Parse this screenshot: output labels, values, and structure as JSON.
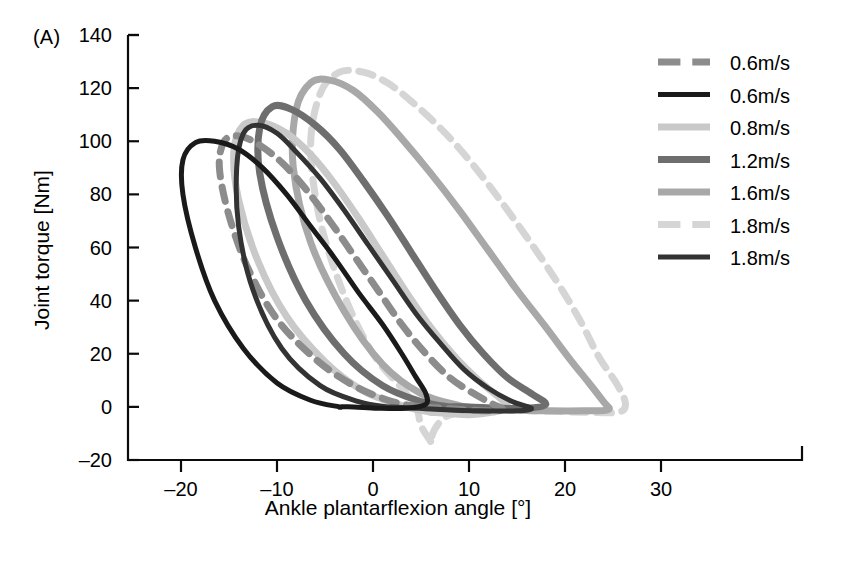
{
  "figure": {
    "panel_label": "(A)",
    "background": "#ffffff"
  },
  "axes": {
    "x": {
      "label": "Ankle plantarflexion angle [°]",
      "ticks": [
        "–20",
        "–10",
        "0",
        "10",
        "20",
        "30"
      ],
      "tick_values": [
        -20,
        -10,
        0,
        10,
        20,
        30
      ],
      "range": [
        -25,
        32
      ]
    },
    "y": {
      "label": "Joint torque [Nm]",
      "ticks": [
        "140",
        "120",
        "100",
        "80",
        "60",
        "40",
        "20",
        "0",
        "–20"
      ],
      "tick_values": [
        140,
        120,
        100,
        80,
        60,
        40,
        20,
        0,
        -20
      ],
      "range": [
        -25,
        145
      ]
    }
  },
  "legend": {
    "position": "top-right",
    "entries": [
      {
        "label": "0.6m/s",
        "color": "#8c8c8c",
        "style": "dashed",
        "width": 7
      },
      {
        "label": "0.6m/s",
        "color": "#1a1a1a",
        "style": "solid",
        "width": 5
      },
      {
        "label": "0.8m/s",
        "color": "#c9c9c9",
        "style": "solid",
        "width": 7
      },
      {
        "label": "1.2m/s",
        "color": "#6e6e6e",
        "style": "solid",
        "width": 7
      },
      {
        "label": "1.6m/s",
        "color": "#a8a8a8",
        "style": "solid",
        "width": 7
      },
      {
        "label": "1.8m/s",
        "color": "#d5d5d5",
        "style": "dashed",
        "width": 7
      },
      {
        "label": "1.8m/s",
        "color": "#333333",
        "style": "solid",
        "width": 5
      }
    ]
  },
  "chart_data": {
    "type": "line",
    "title": "",
    "subtitle": "",
    "xlabel": "Ankle plantarflexion angle [°]",
    "ylabel": "Joint torque [Nm]",
    "xlim": [
      -25,
      32
    ],
    "ylim": [
      -25,
      145
    ],
    "xticks": [
      -20,
      -10,
      0,
      10,
      20,
      30
    ],
    "yticks": [
      -20,
      0,
      20,
      40,
      60,
      80,
      100,
      120,
      140
    ],
    "grid": false,
    "legend_position": "top-right",
    "note": "Ankle joint torque vs plantarflexion angle hysteresis loops for seven walking speeds",
    "series": [
      {
        "name": "0.6m/s",
        "color": "#8c8c8c",
        "style": "dashed",
        "peak_torque": 102,
        "peak_angle": -15.5,
        "points": [
          [
            5.0,
            0.0
          ],
          [
            2.0,
            2.0
          ],
          [
            -2.0,
            8.0
          ],
          [
            -6.0,
            18.0
          ],
          [
            -10.0,
            33.0
          ],
          [
            -13.0,
            52.0
          ],
          [
            -15.0,
            72.0
          ],
          [
            -16.0,
            90.0
          ],
          [
            -15.5,
            100.0
          ],
          [
            -14.0,
            102.0
          ],
          [
            -12.0,
            99.0
          ],
          [
            -9.5,
            92.0
          ],
          [
            -7.0,
            82.0
          ],
          [
            -4.5,
            70.0
          ],
          [
            -2.0,
            57.0
          ],
          [
            0.5,
            44.0
          ],
          [
            3.0,
            31.0
          ],
          [
            5.5,
            20.0
          ],
          [
            8.0,
            11.0
          ],
          [
            10.5,
            5.0
          ],
          [
            12.5,
            1.0
          ],
          [
            13.5,
            -1.0
          ],
          [
            12.0,
            -1.5
          ],
          [
            9.0,
            -1.0
          ],
          [
            7.0,
            -0.5
          ],
          [
            5.0,
            0.0
          ]
        ]
      },
      {
        "name": "0.6m/s",
        "color": "#1a1a1a",
        "style": "solid",
        "peak_torque": 100,
        "peak_angle": -19.0,
        "points": [
          [
            -3.5,
            0.0
          ],
          [
            -6.5,
            2.5
          ],
          [
            -10.0,
            9.0
          ],
          [
            -13.5,
            22.0
          ],
          [
            -16.5,
            40.0
          ],
          [
            -18.5,
            60.0
          ],
          [
            -19.8,
            80.0
          ],
          [
            -19.8,
            93.0
          ],
          [
            -18.5,
            99.5
          ],
          [
            -16.5,
            100.0
          ],
          [
            -14.0,
            97.0
          ],
          [
            -11.5,
            90.0
          ],
          [
            -9.0,
            80.0
          ],
          [
            -6.5,
            68.0
          ],
          [
            -4.0,
            56.0
          ],
          [
            -1.5,
            43.0
          ],
          [
            1.0,
            31.0
          ],
          [
            3.0,
            20.0
          ],
          [
            4.5,
            11.0
          ],
          [
            5.5,
            5.0
          ],
          [
            5.5,
            1.0
          ],
          [
            3.5,
            -0.5
          ],
          [
            0.5,
            -0.5
          ],
          [
            -2.0,
            0.0
          ],
          [
            -3.5,
            0.0
          ]
        ]
      },
      {
        "name": "0.8m/s",
        "color": "#c9c9c9",
        "style": "solid",
        "peak_torque": 107,
        "peak_angle": -14.0,
        "points": [
          [
            6.0,
            -2.0
          ],
          [
            3.0,
            0.5
          ],
          [
            -1.0,
            6.0
          ],
          [
            -5.0,
            17.0
          ],
          [
            -9.0,
            34.0
          ],
          [
            -12.0,
            55.0
          ],
          [
            -14.0,
            78.0
          ],
          [
            -14.5,
            96.0
          ],
          [
            -13.5,
            106.0
          ],
          [
            -11.5,
            107.0
          ],
          [
            -9.0,
            103.0
          ],
          [
            -6.5,
            95.0
          ],
          [
            -4.0,
            84.0
          ],
          [
            -1.5,
            71.0
          ],
          [
            1.0,
            57.0
          ],
          [
            3.5,
            43.0
          ],
          [
            6.0,
            30.0
          ],
          [
            8.5,
            19.0
          ],
          [
            11.0,
            10.0
          ],
          [
            13.0,
            4.0
          ],
          [
            14.0,
            0.0
          ],
          [
            12.5,
            -2.0
          ],
          [
            10.0,
            -3.0
          ],
          [
            8.0,
            -2.5
          ],
          [
            6.0,
            -2.0
          ]
        ]
      },
      {
        "name": "1.2m/s",
        "color": "#6e6e6e",
        "style": "solid",
        "peak_torque": 113,
        "peak_angle": -11.5,
        "points": [
          [
            8.0,
            0.0
          ],
          [
            5.0,
            2.0
          ],
          [
            1.0,
            8.0
          ],
          [
            -3.0,
            20.0
          ],
          [
            -7.0,
            40.0
          ],
          [
            -10.0,
            64.0
          ],
          [
            -11.8,
            88.0
          ],
          [
            -11.8,
            105.0
          ],
          [
            -10.5,
            113.0
          ],
          [
            -8.5,
            112.0
          ],
          [
            -6.0,
            106.0
          ],
          [
            -3.5,
            97.0
          ],
          [
            -1.0,
            85.0
          ],
          [
            1.5,
            72.0
          ],
          [
            4.0,
            58.0
          ],
          [
            6.5,
            44.0
          ],
          [
            9.0,
            31.0
          ],
          [
            11.5,
            20.0
          ],
          [
            14.0,
            11.0
          ],
          [
            16.5,
            5.0
          ],
          [
            18.0,
            1.0
          ],
          [
            16.0,
            -0.5
          ],
          [
            13.0,
            -0.5
          ],
          [
            10.0,
            0.0
          ],
          [
            8.0,
            0.0
          ]
        ]
      },
      {
        "name": "1.6m/s",
        "color": "#a8a8a8",
        "style": "solid",
        "peak_torque": 123,
        "peak_angle": -8.0,
        "points": [
          [
            12.0,
            -1.0
          ],
          [
            9.0,
            0.5
          ],
          [
            5.0,
            5.0
          ],
          [
            1.0,
            16.0
          ],
          [
            -3.0,
            36.0
          ],
          [
            -6.5,
            62.0
          ],
          [
            -8.3,
            90.0
          ],
          [
            -8.0,
            112.0
          ],
          [
            -6.5,
            122.0
          ],
          [
            -4.5,
            123.0
          ],
          [
            -2.0,
            119.0
          ],
          [
            0.5,
            111.0
          ],
          [
            3.0,
            101.0
          ],
          [
            6.0,
            88.0
          ],
          [
            9.0,
            74.0
          ],
          [
            12.0,
            59.0
          ],
          [
            15.0,
            44.0
          ],
          [
            18.0,
            30.0
          ],
          [
            20.5,
            18.0
          ],
          [
            22.5,
            9.0
          ],
          [
            24.0,
            2.0
          ],
          [
            24.5,
            -1.0
          ],
          [
            22.0,
            -1.5
          ],
          [
            18.0,
            -1.5
          ],
          [
            15.0,
            -1.2
          ],
          [
            12.0,
            -1.0
          ]
        ]
      },
      {
        "name": "1.8m/s",
        "color": "#d5d5d5",
        "style": "dashed",
        "peak_torque": 126,
        "peak_angle": -6.0,
        "points": [
          [
            6.0,
            -13.0
          ],
          [
            5.0,
            -7.0
          ],
          [
            4.5,
            0.0
          ],
          [
            3.0,
            7.0
          ],
          [
            0.0,
            20.0
          ],
          [
            -3.0,
            42.0
          ],
          [
            -5.5,
            70.0
          ],
          [
            -6.5,
            98.0
          ],
          [
            -5.5,
            118.0
          ],
          [
            -3.5,
            126.0
          ],
          [
            -1.0,
            126.0
          ],
          [
            1.5,
            122.0
          ],
          [
            4.0,
            115.0
          ],
          [
            7.0,
            105.0
          ],
          [
            10.0,
            93.0
          ],
          [
            13.0,
            79.0
          ],
          [
            16.0,
            64.0
          ],
          [
            19.0,
            48.0
          ],
          [
            21.5,
            33.0
          ],
          [
            23.5,
            19.0
          ],
          [
            25.5,
            8.0
          ],
          [
            26.3,
            1.0
          ],
          [
            25.5,
            -2.0
          ],
          [
            22.0,
            -2.0
          ],
          [
            17.0,
            -1.5
          ],
          [
            12.0,
            -1.0
          ],
          [
            8.0,
            -3.0
          ],
          [
            6.5,
            -8.0
          ],
          [
            6.0,
            -13.0
          ]
        ]
      },
      {
        "name": "1.8m/s",
        "color": "#333333",
        "style": "solid",
        "peak_torque": 106,
        "peak_angle": -13.8,
        "points": [
          [
            1.5,
            0.0
          ],
          [
            -1.5,
            2.0
          ],
          [
            -5.5,
            8.0
          ],
          [
            -9.5,
            22.0
          ],
          [
            -12.5,
            44.0
          ],
          [
            -14.0,
            68.0
          ],
          [
            -14.2,
            90.0
          ],
          [
            -13.5,
            103.0
          ],
          [
            -12.0,
            106.0
          ],
          [
            -10.0,
            103.0
          ],
          [
            -8.0,
            96.0
          ],
          [
            -5.5,
            86.0
          ],
          [
            -3.0,
            74.0
          ],
          [
            -0.5,
            61.0
          ],
          [
            2.0,
            48.0
          ],
          [
            4.5,
            35.0
          ],
          [
            7.0,
            24.0
          ],
          [
            9.5,
            14.0
          ],
          [
            12.0,
            7.0
          ],
          [
            14.5,
            2.0
          ],
          [
            16.5,
            -0.5
          ],
          [
            15.0,
            -1.5
          ],
          [
            11.0,
            -1.5
          ],
          [
            7.0,
            -1.0
          ],
          [
            3.5,
            -0.3
          ],
          [
            1.5,
            0.0
          ]
        ]
      }
    ]
  }
}
